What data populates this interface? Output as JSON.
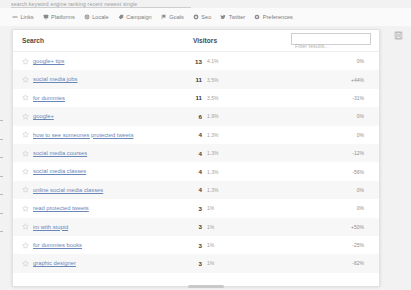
{
  "top_strip": {
    "clipped_text": "search  keyword  engine  ranking  recent  newest  single"
  },
  "toolbar": {
    "items": [
      {
        "label": "Links",
        "icon": "link-icon"
      },
      {
        "label": "Platforms",
        "icon": "monitor-icon"
      },
      {
        "label": "Locale",
        "icon": "globe-icon"
      },
      {
        "label": "Campaign",
        "icon": "tag-icon"
      },
      {
        "label": "Goals",
        "icon": "flag-icon"
      },
      {
        "label": "Seo",
        "icon": "target-icon"
      },
      {
        "label": "Twitter",
        "icon": "twitter-icon"
      },
      {
        "label": "Preferences",
        "icon": "gear-icon"
      }
    ]
  },
  "panel": {
    "columns": {
      "search": "Search",
      "visitors": "Visitors"
    },
    "filter": {
      "value": "",
      "placeholder": "Filter results..."
    },
    "save_icon": "save-icon"
  },
  "chart_data": {
    "type": "bar",
    "title": "Search",
    "xlabel": "",
    "ylabel": "Visitors",
    "categories": [
      "google+ tips",
      "social media jobs",
      "for dummies",
      "google+",
      "how to see someones protected tweets",
      "social media courses",
      "social media classes",
      "online social media classes",
      "read protected tweets",
      "im with stupid",
      "for dummies books",
      "graphic designer"
    ],
    "values": [
      13,
      11,
      11,
      6,
      4,
      4,
      4,
      4,
      3,
      3,
      3,
      3
    ],
    "share_pct": [
      "4.1%",
      "3.5%",
      "3.5%",
      "1.9%",
      "1.3%",
      "1.3%",
      "1.3%",
      "1.3%",
      "1%",
      "1%",
      "1%",
      "1%"
    ],
    "change_pct": [
      "0%",
      "+44%",
      "-31%",
      "0%",
      "0%",
      "-12%",
      "-56%",
      "0%",
      "0%",
      "+50%",
      "-25%",
      "-82%"
    ],
    "bar_widths": [
      104,
      91,
      91,
      49,
      33,
      33,
      33,
      33,
      25,
      25,
      25,
      25
    ],
    "starred": [
      false,
      false,
      false,
      false,
      false,
      false,
      false,
      false,
      false,
      false,
      false,
      false
    ],
    "ylim": [
      0,
      13
    ],
    "grid": false,
    "legend": "none"
  },
  "colors": {
    "bar": "#9a9a9a",
    "link": "#6b86b8",
    "row_alt": "#f7f7f7",
    "panel_bg": "#ffffff",
    "page_bg": "#f2f2f2"
  }
}
